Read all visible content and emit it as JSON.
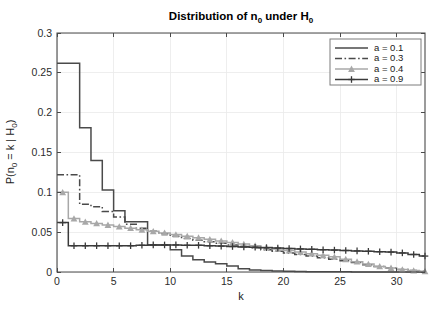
{
  "figure": {
    "title_main": "Distribution of n",
    "title_sub1": "0",
    "title_mid": " under H",
    "title_sub2": "0",
    "title_plain": "Distribution of n_0 under H_0",
    "background": "#ffffff"
  },
  "axes": {
    "xlabel": "k",
    "ylabel_parts": {
      "p1": "P(n",
      "s1": "0",
      "p2": " = k | H",
      "s2": "0",
      "p3": ")"
    },
    "ylabel_plain": "P(n_0 = k | H_0)",
    "x_ticks": [
      "0",
      "5",
      "10",
      "15",
      "20",
      "25",
      "30"
    ],
    "x_tick_values": [
      0,
      5,
      10,
      15,
      20,
      25,
      30
    ],
    "y_ticks": [
      "0",
      "0.05",
      "0.1",
      "0.15",
      "0.2",
      "0.25",
      "0.3"
    ],
    "y_tick_values": [
      0,
      0.05,
      0.1,
      0.15,
      0.2,
      0.25,
      0.3
    ],
    "xlim": [
      0,
      32.5
    ],
    "ylim": [
      0,
      0.3
    ],
    "grid": true,
    "axis_color": "#4a4a4a",
    "grid_color": "#eaeaea"
  },
  "legend": {
    "position": "top-right",
    "entries": [
      {
        "label": "a = 0.1",
        "color": "#4a4a4a",
        "style": "solid",
        "marker": "none"
      },
      {
        "label": "a = 0.3",
        "color": "#4a4a4a",
        "style": "dashdot",
        "marker": "none"
      },
      {
        "label": "a = 0.4",
        "color": "#a8a8a8",
        "style": "solid",
        "marker": "triangle"
      },
      {
        "label": "a = 0.9",
        "color": "#3a3a3a",
        "style": "solid",
        "marker": "plus"
      }
    ]
  },
  "chart_data": {
    "type": "line",
    "xlabel": "k",
    "ylabel": "P(n_0 = k | H_0)",
    "xlim": [
      0,
      32.5
    ],
    "ylim": [
      0,
      0.3
    ],
    "grid": true,
    "legend_position": "top-right",
    "drawstyle": "steps-post",
    "x": [
      0,
      1,
      2,
      3,
      4,
      5,
      6,
      7,
      8,
      9,
      10,
      11,
      12,
      13,
      14,
      15,
      16,
      17,
      18,
      19,
      20,
      21,
      22,
      23,
      24,
      25,
      26,
      27,
      28,
      29,
      30,
      31,
      32
    ],
    "series": [
      {
        "name": "a = 0.1",
        "color": "#4a4a4a",
        "style": "solid",
        "marker": "none",
        "values": [
          0.262,
          0.262,
          0.181,
          0.14,
          0.103,
          0.077,
          0.063,
          0.063,
          0.034,
          0.034,
          0.028,
          0.02,
          0.0155,
          0.0125,
          0.0105,
          0.0075,
          0.004,
          0.0025,
          0.0018,
          0.0012,
          0.0008,
          0.0006,
          0.0004,
          0.0003,
          0.0002,
          0.0002,
          0.0001,
          0.0001,
          0.0001,
          0.0001,
          0.0001,
          0.0001,
          0.0001
        ]
      },
      {
        "name": "a = 0.3",
        "color": "#4a4a4a",
        "style": "dashdot",
        "marker": "none",
        "values": [
          0.122,
          0.122,
          0.085,
          0.082,
          0.076,
          0.069,
          0.06,
          0.055,
          0.051,
          0.048,
          0.045,
          0.042,
          0.04,
          0.038,
          0.036,
          0.034,
          0.032,
          0.03,
          0.028,
          0.026,
          0.024,
          0.022,
          0.02,
          0.018,
          0.016,
          0.014,
          0.012,
          0.009,
          0.007,
          0.005,
          0.003,
          0.0018,
          0.0008
        ]
      },
      {
        "name": "a = 0.4",
        "color": "#a8a8a8",
        "style": "solid",
        "marker": "triangle",
        "values": [
          0.1,
          0.067,
          0.063,
          0.061,
          0.059,
          0.057,
          0.055,
          0.053,
          0.051,
          0.049,
          0.047,
          0.045,
          0.043,
          0.041,
          0.039,
          0.037,
          0.035,
          0.033,
          0.031,
          0.029,
          0.027,
          0.025,
          0.023,
          0.021,
          0.019,
          0.016,
          0.013,
          0.01,
          0.007,
          0.005,
          0.003,
          0.0018,
          0.0008
        ]
      },
      {
        "name": "a = 0.9",
        "color": "#3a3a3a",
        "style": "solid",
        "marker": "plus",
        "values": [
          0.062,
          0.033,
          0.033,
          0.033,
          0.033,
          0.033,
          0.033,
          0.0335,
          0.034,
          0.034,
          0.034,
          0.0335,
          0.0335,
          0.033,
          0.0325,
          0.032,
          0.0315,
          0.031,
          0.0305,
          0.03,
          0.0295,
          0.029,
          0.0285,
          0.028,
          0.0275,
          0.027,
          0.0265,
          0.026,
          0.0255,
          0.025,
          0.024,
          0.022,
          0.02
        ]
      }
    ]
  }
}
